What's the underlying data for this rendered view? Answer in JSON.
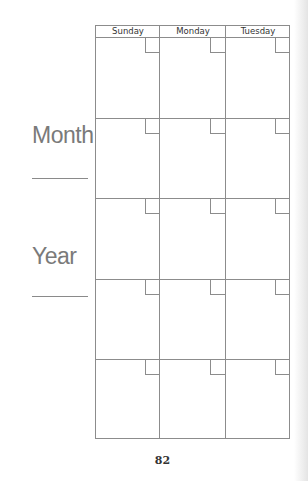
{
  "page": {
    "number": "82",
    "line_color": "#8c8c8c",
    "label_color": "#7a7a7a"
  },
  "side_labels": {
    "month": "Month",
    "year": "Year"
  },
  "calendar": {
    "days": [
      "Sunday",
      "Monday",
      "Tuesday"
    ],
    "rows": 5
  }
}
